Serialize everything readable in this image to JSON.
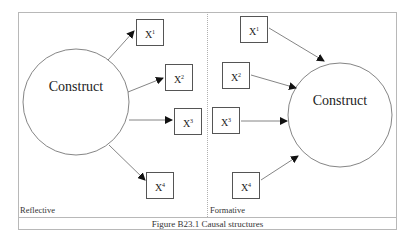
{
  "caption": "Figure B23.1 Causal structures",
  "panels": [
    {
      "name": "Reflective",
      "construct_label": "Construct",
      "direction": "construct-to-indicators",
      "indicators": [
        {
          "base": "X",
          "sup": "1"
        },
        {
          "base": "X",
          "sup": "2"
        },
        {
          "base": "X",
          "sup": "3"
        },
        {
          "base": "X",
          "sup": "4"
        }
      ]
    },
    {
      "name": "Formative",
      "construct_label": "Construct",
      "direction": "indicators-to-construct",
      "indicators": [
        {
          "base": "X",
          "sup": "1"
        },
        {
          "base": "X",
          "sup": "2"
        },
        {
          "base": "X",
          "sup": "3"
        },
        {
          "base": "X",
          "sup": "4"
        }
      ]
    }
  ]
}
